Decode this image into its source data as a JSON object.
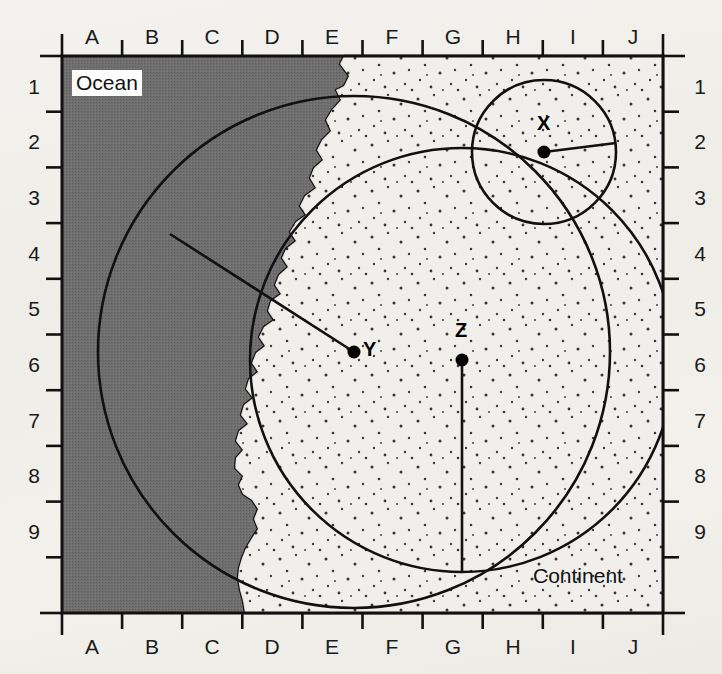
{
  "figure": {
    "kind": "schematic-map"
  },
  "axes": {
    "columns": [
      "A",
      "B",
      "C",
      "D",
      "E",
      "F",
      "G",
      "H",
      "I",
      "J"
    ],
    "rows": [
      "1",
      "2",
      "3",
      "4",
      "5",
      "6",
      "7",
      "8",
      "9"
    ],
    "top_labels": [
      "A",
      "B",
      "C",
      "D",
      "E",
      "F",
      "G",
      "H",
      "I",
      "J"
    ],
    "bottom_labels": [
      "A",
      "B",
      "C",
      "D",
      "E",
      "F",
      "G",
      "H",
      "I",
      "J"
    ],
    "left_labels": [
      "1",
      "2",
      "3",
      "4",
      "5",
      "6",
      "7",
      "8",
      "9"
    ],
    "right_labels": [
      "1",
      "2",
      "3",
      "4",
      "5",
      "6",
      "7",
      "8",
      "9"
    ]
  },
  "regions": [
    {
      "id": "ocean",
      "label": "Ocean",
      "fill": "#6e6e6e",
      "label_boxed": true
    },
    {
      "id": "continent",
      "label": "Continent",
      "fill": "#f0eeea",
      "label_boxed": false
    }
  ],
  "points": [
    {
      "id": "X",
      "label": "X",
      "grid": "I2",
      "label_offset": "above-left"
    },
    {
      "id": "Y",
      "label": "Y",
      "grid": "E5",
      "label_offset": "right"
    },
    {
      "id": "Z",
      "label": "Z",
      "grid": "G5",
      "label_offset": "above"
    }
  ],
  "circles": [
    {
      "center": "X",
      "radius_direction": "east",
      "note": "small circle, radius drawn to the right"
    },
    {
      "center": "Y",
      "radius_direction": "northwest",
      "note": "large circle, radius drawn up-left into the ocean"
    },
    {
      "center": "Z",
      "radius_direction": "south",
      "note": "large circle, radius drawn straight down"
    }
  ],
  "colors": {
    "ocean_fill": "#6e6e6e",
    "land_fill": "#f0eeea",
    "stroke": "#111111",
    "paper": "#f2f0ec",
    "text": "#111111"
  }
}
